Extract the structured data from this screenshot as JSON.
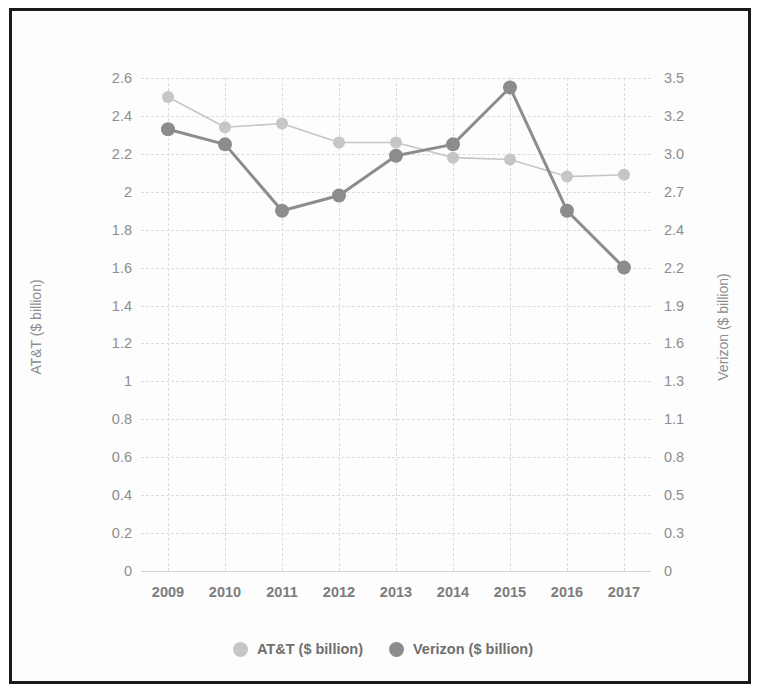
{
  "chart_data": {
    "type": "line",
    "title": "",
    "xlabel": "",
    "categories": [
      "2009",
      "2010",
      "2011",
      "2012",
      "2013",
      "2014",
      "2015",
      "2016",
      "2017"
    ],
    "grid": true,
    "legend_position": "bottom",
    "series": [
      {
        "name": "AT&T ($ billion)",
        "axis": "left",
        "color": "#c6c6c6",
        "marker": "circle",
        "values": [
          2.5,
          2.34,
          2.36,
          2.26,
          2.26,
          2.18,
          2.17,
          2.08,
          2.09
        ]
      },
      {
        "name": "Verizon ($ billion)",
        "axis": "right",
        "color": "#8c8c8c",
        "marker": "circle",
        "values": [
          2.33,
          2.25,
          1.9,
          1.98,
          2.19,
          2.25,
          2.55,
          1.9,
          1.6
        ]
      }
    ],
    "left_axis": {
      "label": "AT&T ($ billion)",
      "ylim": [
        0,
        2.6
      ],
      "ticks": [
        "2.6",
        "2.4",
        "2.2",
        "2",
        "1.8",
        "1.6",
        "1.4",
        "1.2",
        "1",
        "0.8",
        "0.6",
        "0.4",
        "0.2",
        "0"
      ],
      "tick_values": [
        2.6,
        2.4,
        2.2,
        2.0,
        1.8,
        1.6,
        1.4,
        1.2,
        1.0,
        0.8,
        0.6,
        0.4,
        0.2,
        0
      ]
    },
    "right_axis": {
      "label": "Verizon ($ billion)",
      "ylim": [
        0,
        3.5
      ],
      "ticks": [
        "3.5",
        "3.2",
        "3.0",
        "2.7",
        "2.4",
        "2.2",
        "1.9",
        "1.6",
        "1.3",
        "1.1",
        "0.8",
        "0.5",
        "0.3",
        "0"
      ],
      "tick_values": [
        3.5,
        3.2,
        3.0,
        2.7,
        2.4,
        2.2,
        1.9,
        1.6,
        1.3,
        1.1,
        0.8,
        0.5,
        0.3,
        0
      ]
    }
  },
  "legend": {
    "items": [
      {
        "label": "AT&T ($ billion)",
        "color": "#c6c6c6"
      },
      {
        "label": "Verizon ($ billion)",
        "color": "#8c8c8c"
      }
    ]
  },
  "colors": {
    "att": "#c6c6c6",
    "verizon": "#8c8c8c",
    "grid": "#dcdcdc",
    "tick_text": "#8d8d8d",
    "xtick_text": "#7c7c7c",
    "frame": "#1a1a1a"
  }
}
